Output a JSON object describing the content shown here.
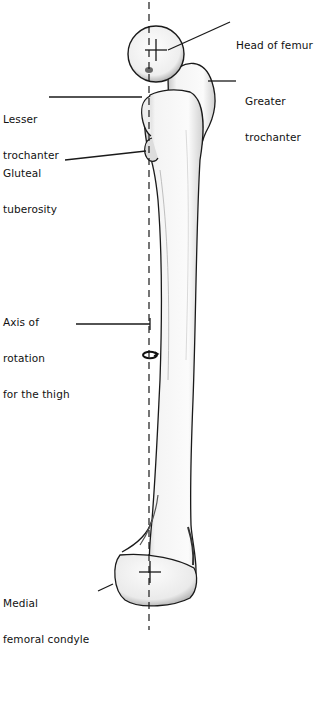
{
  "figure": {
    "type": "anatomical-illustration",
    "colors": {
      "outline": "#1a1a1a",
      "bone_fill": "#f7f7f7",
      "shading": "#9a9a9a",
      "background": "#ffffff"
    }
  },
  "labels": {
    "head_of_femur": {
      "lines": [
        "Head of femur"
      ]
    },
    "greater_trochanter": {
      "lines": [
        "Greater",
        "trochanter"
      ]
    },
    "lesser_trochanter": {
      "lines": [
        "Lesser",
        "trochanter"
      ]
    },
    "gluteal_tuberosity": {
      "lines": [
        "Gluteal",
        "tuberosity"
      ]
    },
    "axis_of_rotation": {
      "lines": [
        "Axis of",
        "rotation",
        "for the thigh"
      ]
    },
    "medial_femoral_condyle": {
      "lines": [
        "Medial",
        "femoral condyle"
      ]
    }
  }
}
